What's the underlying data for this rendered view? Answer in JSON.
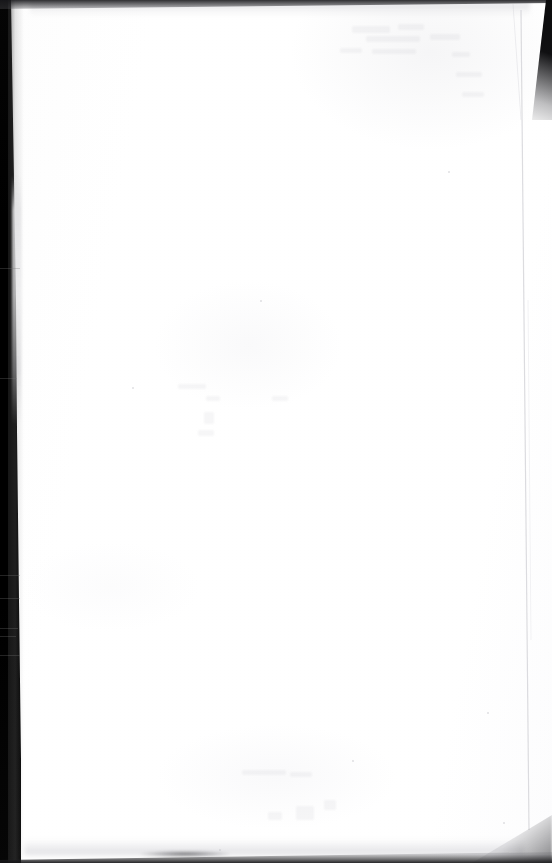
{
  "document": {
    "kind": "scanned-page",
    "page_side": "blank-verso",
    "content_text": "",
    "visible_text_count": 0,
    "width_px": 552,
    "height_px": 863
  },
  "page": {
    "paper_color": "#ffffff",
    "paper_tint": "#fdfdfd",
    "has_printed_content": "no",
    "note": ""
  },
  "artifacts": {
    "gutter_band": {
      "name": "left-scanner-gutter",
      "color": "#000000",
      "width_top_px": 11,
      "width_bottom_px": 21,
      "side": "left"
    },
    "top_edge": {
      "name": "top-page-edge-shadow",
      "color": "#19191c",
      "height_px": 9
    },
    "bottom_edge": {
      "name": "bottom-page-edge-shadow",
      "color": "#141416",
      "height_px": 11
    },
    "corner_wedge_top_right": {
      "name": "top-right-corner-wedge",
      "color": "#0b0b0c"
    },
    "right_page_edge": {
      "name": "right-page-edge-line",
      "color": "#d2d2d6",
      "x_px": 527
    },
    "bleed_through": {
      "name": "reverse-side-ghosting",
      "color": "#787884",
      "legible": "no"
    }
  },
  "colors": {
    "background": "#ffffff",
    "shadow": "#000000",
    "edge_line": "#d2d2d6",
    "bleed": "#787884"
  }
}
